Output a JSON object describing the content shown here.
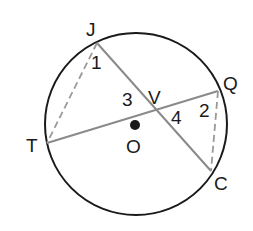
{
  "diagram": {
    "type": "circle-geometry",
    "circle": {
      "center": "O",
      "cx": 136,
      "cy": 124,
      "r": 91,
      "stroke": "#1a1a1a"
    },
    "points": {
      "J": {
        "label": "J",
        "x": 97,
        "y": 43
      },
      "T": {
        "label": "T",
        "x": 47,
        "y": 143
      },
      "Q": {
        "label": "Q",
        "x": 218,
        "y": 91
      },
      "C": {
        "label": "C",
        "x": 211,
        "y": 171
      },
      "V": {
        "label": "V",
        "x": 155,
        "y": 110
      },
      "O": {
        "label": "O",
        "x": 135,
        "y": 125
      }
    },
    "chords": [
      {
        "from": "J",
        "to": "C",
        "style": "solid",
        "color": "#8a8a8a"
      },
      {
        "from": "T",
        "to": "Q",
        "style": "solid",
        "color": "#8a8a8a"
      }
    ],
    "dashed_segments": [
      {
        "from": "J",
        "to": "T",
        "style": "dashed",
        "color": "#9a9a9a"
      },
      {
        "from": "Q",
        "to": "C",
        "style": "dashed",
        "color": "#9a9a9a"
      }
    ],
    "angle_labels": {
      "a1": "1",
      "a2": "2",
      "a3": "3",
      "a4": "4"
    }
  }
}
